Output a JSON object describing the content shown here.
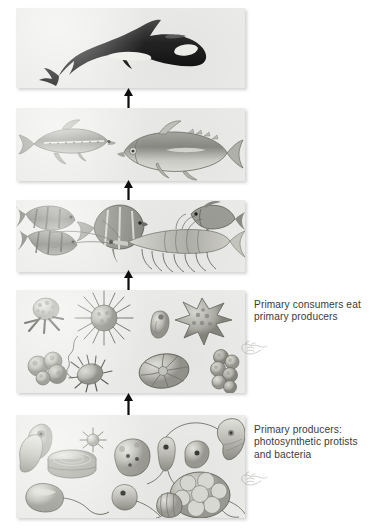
{
  "figure": {
    "background_color": "#ffffff",
    "panel_color": "#ebebe9",
    "ink_color": "#1a1a1a",
    "caption_color": "#3b3b3b"
  },
  "levels": [
    {
      "id": "level-5-top-predator",
      "organisms": "Killer whale (orca)",
      "caption": ""
    },
    {
      "id": "level-4-large-fish",
      "organisms": "Lanternfish and tuna",
      "caption": ""
    },
    {
      "id": "level-3-small-fish-krill",
      "organisms": "Small reef fish and krill",
      "caption": ""
    },
    {
      "id": "level-2-primary-consumers",
      "organisms": "Zooplankton: radiolarians, foraminifera, ciliates",
      "caption": "Primary consumers eat\nprimary producers"
    },
    {
      "id": "level-1-primary-producers",
      "organisms": "Phytoplankton: diatoms, dinoflagellates, flagellates",
      "caption": "Primary producers:\nphotosynthetic protists\nand bacteria"
    }
  ],
  "arrows": {
    "direction": "up",
    "meaning": "energy flow to next trophic level",
    "count": 4
  }
}
